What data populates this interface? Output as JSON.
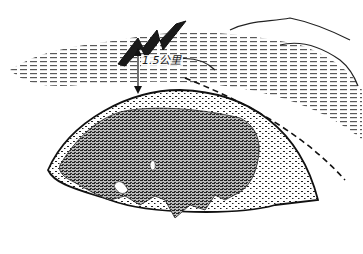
{
  "illustration": {
    "subject": "Earth globe showing Eurasia with lightning above cloud layer",
    "height_label": "1.5公里",
    "icons": [
      "lightning-bolt-icon",
      "double-arrow-icon"
    ],
    "colors": {
      "ink": "#1a1a1a",
      "background": "#ffffff"
    }
  }
}
